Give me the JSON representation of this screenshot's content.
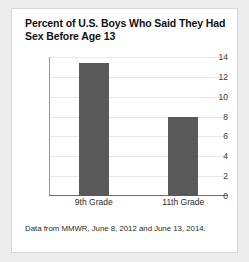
{
  "card": {
    "background_color": "#ffffff",
    "border_color": "#d8d8d8"
  },
  "page": {
    "background_color": "#ececec"
  },
  "footnote": "Data from MMWR, June 8, 2012 and June 13, 2014.",
  "chart_data": {
    "type": "bar",
    "title": "Percent of U.S. Boys Who Said They Had Sex Before Age 13",
    "categories": [
      "9th Grade",
      "11th Grade"
    ],
    "values": [
      13.4,
      8.0
    ],
    "xlabel": "",
    "ylabel": "",
    "ylim": [
      0,
      14
    ],
    "yticks": [
      0,
      2,
      4,
      6,
      8,
      10,
      12,
      14
    ],
    "ytick_labels": [
      "0",
      "2",
      "4",
      "6",
      "8",
      "10",
      "12",
      "14"
    ],
    "grid": true,
    "legend": false,
    "bar_color": "#595959",
    "gridline_color": "#e7e7e7",
    "axis_color": "#6f6f6f"
  }
}
